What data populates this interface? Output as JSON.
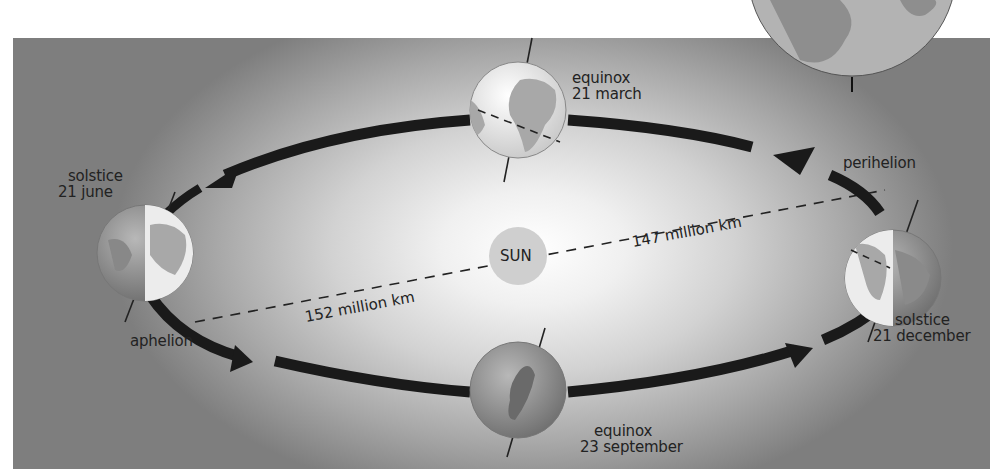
{
  "diagram": {
    "center": {
      "label": "SUN",
      "color": "#cfcfcf"
    },
    "positions": [
      {
        "id": "equinox-march",
        "event": "equinox",
        "date": "21 march"
      },
      {
        "id": "solstice-june",
        "event": "solstice",
        "date": "21 june"
      },
      {
        "id": "equinox-september",
        "event": "equinox",
        "date": "23 september"
      },
      {
        "id": "solstice-december",
        "event": "solstice",
        "date": "21 december"
      }
    ],
    "orbit_points": {
      "aphelion": {
        "label": "aphelion",
        "distance": "152 million km"
      },
      "perihelion": {
        "label": "perihelion",
        "distance": "147 million km"
      }
    },
    "colors": {
      "background_light": "#ffffff",
      "background_dark": "#7e7e7e",
      "orbit_arrow": "#1a1a1a",
      "globe_land": "#9a9a9a",
      "globe_ocean": "#bdbdbd",
      "globe_lit": "#ececec"
    }
  }
}
